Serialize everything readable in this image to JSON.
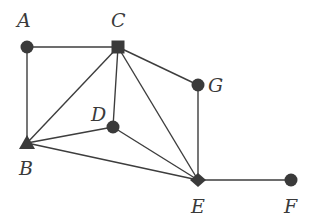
{
  "diagram": {
    "type": "graph",
    "nodes": [
      {
        "id": "A",
        "label": "A",
        "shape": "circle",
        "x": 27,
        "y": 47,
        "lx": 17,
        "ly": 27
      },
      {
        "id": "B",
        "label": "B",
        "shape": "triangle",
        "x": 27,
        "y": 143,
        "lx": 19,
        "ly": 175
      },
      {
        "id": "C",
        "label": "C",
        "shape": "square",
        "x": 118,
        "y": 47,
        "lx": 111,
        "ly": 27
      },
      {
        "id": "D",
        "label": "D",
        "shape": "circle",
        "x": 113,
        "y": 127,
        "lx": 91,
        "ly": 121
      },
      {
        "id": "E",
        "label": "E",
        "shape": "diamond",
        "x": 198,
        "y": 180,
        "lx": 191,
        "ly": 213
      },
      {
        "id": "F",
        "label": "F",
        "shape": "circle",
        "x": 291,
        "y": 180,
        "lx": 284,
        "ly": 213
      },
      {
        "id": "G",
        "label": "G",
        "shape": "circle",
        "x": 198,
        "y": 85,
        "lx": 208,
        "ly": 92
      }
    ],
    "edges": [
      [
        "A",
        "C"
      ],
      [
        "A",
        "B"
      ],
      [
        "C",
        "B"
      ],
      [
        "C",
        "D"
      ],
      [
        "C",
        "E"
      ],
      [
        "C",
        "G"
      ],
      [
        "B",
        "D"
      ],
      [
        "B",
        "E"
      ],
      [
        "D",
        "E"
      ],
      [
        "G",
        "E"
      ],
      [
        "E",
        "F"
      ]
    ]
  }
}
